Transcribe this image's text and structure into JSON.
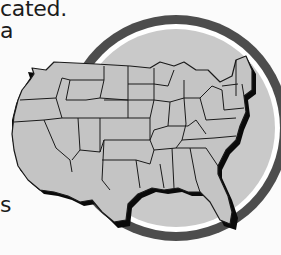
{
  "text_fragments": [
    {
      "text": "cated."
    },
    {
      "text": "a"
    },
    {
      "text": "s"
    }
  ],
  "figure": {
    "icon": "usa-map-icon",
    "colors": {
      "map_fill": "#c4c4c4",
      "map_border": "#1a1a1a",
      "map_shadow": "#0a0a0a",
      "disc_fill": "#c9c9c9",
      "inner_ring": "#ffffff",
      "outer_ring": "#4d4d4d",
      "background": "#fbfbfb"
    }
  }
}
